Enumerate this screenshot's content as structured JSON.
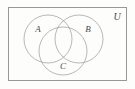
{
  "figure": {
    "type": "venn-diagram-3-set",
    "title": "",
    "background_color": "#fdfdfc",
    "stroke_color": "#9a9a9a",
    "label_color": "#4a4a4a"
  },
  "universe": {
    "label": "U",
    "label_x": 117,
    "label_y": 18,
    "rect": {
      "x": 8.5,
      "y": 7.5,
      "width": 118,
      "height": 73
    }
  },
  "sets": [
    {
      "id": "A",
      "label": "A",
      "cx": 48,
      "cy": 39,
      "r": 24,
      "label_x": 38,
      "label_y": 30
    },
    {
      "id": "B",
      "label": "B",
      "cx": 79,
      "cy": 39,
      "r": 24,
      "label_x": 88,
      "label_y": 30
    },
    {
      "id": "C",
      "label": "C",
      "cx": 63,
      "cy": 51,
      "r": 24,
      "label_x": 63,
      "label_y": 67
    }
  ]
}
